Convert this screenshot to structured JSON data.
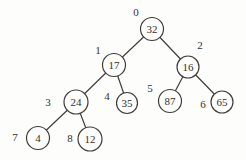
{
  "figure": {
    "type": "binary-tree",
    "background_color": "#fdfdfb",
    "line_color": "#413e3a",
    "text_color": "#34312d",
    "node_fill": "#fdfdfb",
    "nodes": [
      {
        "index": "0",
        "value": "32",
        "x": 152,
        "y": 29,
        "r": 11.5,
        "ix": 136,
        "iy": 12
      },
      {
        "index": "1",
        "value": "17",
        "x": 114,
        "y": 65,
        "r": 11.5,
        "ix": 98,
        "iy": 50
      },
      {
        "index": "2",
        "value": "16",
        "x": 188,
        "y": 67,
        "r": 11,
        "ix": 200,
        "iy": 45
      },
      {
        "index": "3",
        "value": "24",
        "x": 76,
        "y": 102,
        "r": 12,
        "ix": 48,
        "iy": 102
      },
      {
        "index": "4",
        "value": "35",
        "x": 127,
        "y": 103,
        "r": 10.5,
        "ix": 107,
        "iy": 96
      },
      {
        "index": "5",
        "value": "87",
        "x": 170,
        "y": 101,
        "r": 11.5,
        "ix": 150,
        "iy": 88
      },
      {
        "index": "6",
        "value": "65",
        "x": 222,
        "y": 102,
        "r": 11,
        "ix": 203,
        "iy": 104
      },
      {
        "index": "7",
        "value": "4",
        "x": 38,
        "y": 138,
        "r": 11.5,
        "ix": 15,
        "iy": 137
      },
      {
        "index": "8",
        "value": "12",
        "x": 90,
        "y": 139,
        "r": 12,
        "ix": 70,
        "iy": 138
      }
    ],
    "edges": [
      {
        "from": 0,
        "to": 1
      },
      {
        "from": 0,
        "to": 2
      },
      {
        "from": 1,
        "to": 3
      },
      {
        "from": 1,
        "to": 4
      },
      {
        "from": 2,
        "to": 5
      },
      {
        "from": 2,
        "to": 6
      },
      {
        "from": 3,
        "to": 7
      },
      {
        "from": 3,
        "to": 8
      }
    ]
  }
}
